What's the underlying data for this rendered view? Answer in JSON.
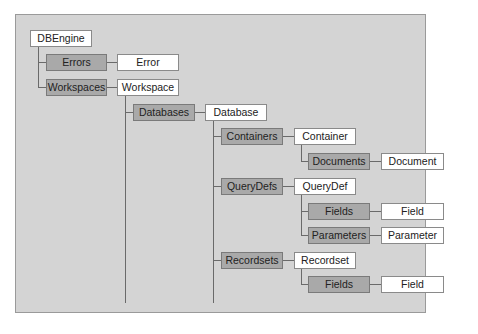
{
  "diagram": {
    "root": "DBEngine",
    "nodes": {
      "dbengine": "DBEngine",
      "errors": "Errors",
      "error": "Error",
      "workspaces": "Workspaces",
      "workspace": "Workspace",
      "databases": "Databases",
      "database": "Database",
      "containers": "Containers",
      "container": "Container",
      "documents": "Documents",
      "document": "Document",
      "querydefs": "QueryDefs",
      "querydef": "QueryDef",
      "qd_fields": "Fields",
      "qd_field": "Field",
      "parameters": "Parameters",
      "parameter": "Parameter",
      "recordsets": "Recordsets",
      "recordset": "Recordset",
      "rs_fields": "Fields",
      "rs_field": "Field"
    },
    "colors": {
      "panel": "#d4d4d4",
      "collection_box": "#a9a9a9",
      "object_box": "#ffffff",
      "connector": "#6a6a6a"
    }
  }
}
